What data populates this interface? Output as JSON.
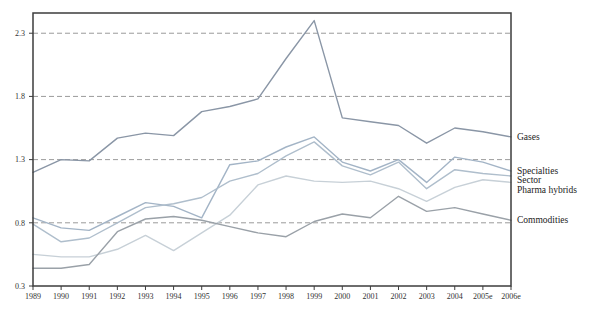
{
  "chart_data": {
    "type": "line",
    "title": "",
    "xlabel": "",
    "ylabel": "",
    "x_categories": [
      "1989",
      "1990",
      "1991",
      "1992",
      "1993",
      "1994",
      "1995",
      "1996",
      "1997",
      "1998",
      "1999",
      "2000",
      "2001",
      "2002",
      "2003",
      "2004",
      "2005e",
      "2006e"
    ],
    "y_ticks": [
      0.3,
      0.8,
      1.3,
      1.8,
      2.3
    ],
    "y_tick_labels": [
      "0.3",
      "0.8",
      "1.3",
      "1.8",
      "2.3"
    ],
    "ylim": [
      0.3,
      2.46
    ],
    "grid": "horizontal-dashed-at-ticks-above-baseline",
    "legend_position": "right-end-of-line-labels",
    "frame_color": "#3c3c3c",
    "grid_color": "#8f8f8f",
    "series": [
      {
        "name": "Gases",
        "color": "#8a96a6",
        "values": [
          1.2,
          1.3,
          1.29,
          1.47,
          1.51,
          1.49,
          1.68,
          1.72,
          1.78,
          2.1,
          2.4,
          1.63,
          1.6,
          1.57,
          1.43,
          1.55,
          1.52,
          1.48
        ]
      },
      {
        "name": "Specialties",
        "color": "#a3b4c6",
        "values": [
          0.84,
          0.76,
          0.74,
          0.85,
          0.96,
          0.93,
          0.84,
          1.26,
          1.29,
          1.4,
          1.48,
          1.28,
          1.21,
          1.3,
          1.12,
          1.32,
          1.28,
          1.21
        ]
      },
      {
        "name": "Sector",
        "color": "#afbecc",
        "values": [
          0.79,
          0.65,
          0.68,
          0.8,
          0.92,
          0.95,
          1.0,
          1.13,
          1.19,
          1.33,
          1.44,
          1.25,
          1.18,
          1.28,
          1.07,
          1.22,
          1.19,
          1.17
        ]
      },
      {
        "name": "Pharma hybrids",
        "color": "#c7d0d7",
        "values": [
          0.55,
          0.53,
          0.53,
          0.59,
          0.7,
          0.58,
          0.72,
          0.86,
          1.1,
          1.17,
          1.13,
          1.12,
          1.13,
          1.07,
          0.97,
          1.08,
          1.14,
          1.12
        ]
      },
      {
        "name": "Commodities",
        "color": "#9aa1a8",
        "values": [
          0.44,
          0.44,
          0.47,
          0.73,
          0.83,
          0.85,
          0.82,
          0.77,
          0.72,
          0.69,
          0.81,
          0.87,
          0.84,
          1.01,
          0.89,
          0.92,
          0.87,
          0.82
        ]
      }
    ]
  }
}
